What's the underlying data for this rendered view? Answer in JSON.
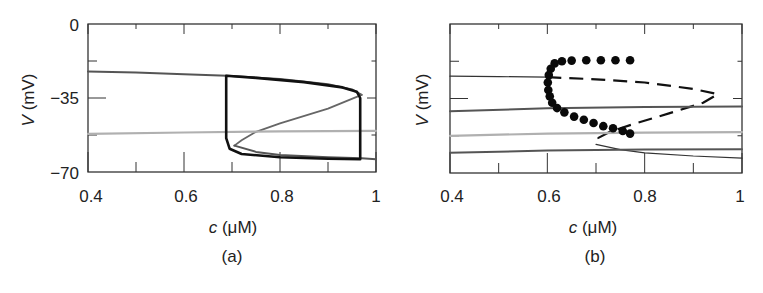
{
  "figure": {
    "panels": [
      {
        "id": "a",
        "caption": "(a)",
        "xlabel_var": "c",
        "xlabel_unit": " (μM)",
        "ylabel_var": "V",
        "ylabel_unit": " (mV)",
        "xticks": [
          "0.4",
          "0.6",
          "0.8",
          "1"
        ],
        "yticks": [
          "0",
          "−35",
          "−70"
        ]
      },
      {
        "id": "b",
        "caption": "(b)",
        "xlabel_var": "c",
        "xlabel_unit": " (μM)",
        "ylabel_var": "V",
        "ylabel_unit": " (mV)",
        "xticks": [
          "0.4",
          "0.6",
          "0.8",
          "1"
        ],
        "yticks": []
      }
    ],
    "colors": {
      "axis": "#333333",
      "stable_branch": "#555555",
      "unstable_branch": "#666666",
      "nullcline": "#b0b0b0",
      "trajectory": "#111111",
      "periodic_orbit_dots": "#0a0a0a"
    }
  },
  "chart_data": [
    {
      "type": "line",
      "title": "(a)",
      "xlabel": "c (μM)",
      "ylabel": "V (mV)",
      "xlim": [
        0.4,
        1.0
      ],
      "ylim": [
        -70,
        0
      ],
      "xticks": [
        0.4,
        0.5,
        0.6,
        0.7,
        0.8,
        0.9,
        1.0
      ],
      "xtick_labels": [
        "0.4",
        "0.6",
        "0.8",
        "1"
      ],
      "yticks": [
        0,
        -17.5,
        -35,
        -52.5,
        -70
      ],
      "ytick_labels": [
        "0",
        "−35",
        "−70"
      ],
      "grid": false,
      "legend": null,
      "series": [
        {
          "name": "upper stable branch (dark gray)",
          "style": "solid",
          "x": [
            0.4,
            0.5,
            0.6,
            0.69,
            0.8,
            0.9,
            0.95,
            0.97
          ],
          "y": [
            -22.5,
            -23,
            -23.8,
            -24.5,
            -26,
            -28.5,
            -31,
            -33.5
          ]
        },
        {
          "name": "middle unstable branch (gray)",
          "style": "solid",
          "x": [
            0.97,
            0.9,
            0.8,
            0.75,
            0.72,
            0.705
          ],
          "y": [
            -33.5,
            -40,
            -47,
            -51,
            -55,
            -57.5
          ]
        },
        {
          "name": "lower stable branch (dark gray)",
          "style": "solid",
          "x": [
            0.705,
            0.75,
            0.8,
            0.9,
            0.97,
            1.0
          ],
          "y": [
            -57.5,
            -60.5,
            -62,
            -63,
            -63.5,
            -64
          ]
        },
        {
          "name": "nullcline (light gray)",
          "style": "solid",
          "x": [
            0.4,
            0.6,
            0.8,
            1.0
          ],
          "y": [
            -52,
            -51.3,
            -50.8,
            -50.5
          ]
        },
        {
          "name": "relaxation oscillation trajectory (black, thick)",
          "style": "solid",
          "x": [
            0.688,
            0.688,
            0.75,
            0.85,
            0.93,
            0.96,
            0.967,
            0.967,
            0.9,
            0.8,
            0.72,
            0.695,
            0.688,
            0.688
          ],
          "y": [
            -24.5,
            -24.5,
            -25.5,
            -27.5,
            -30,
            -32,
            -35,
            -64,
            -63.7,
            -63,
            -61.5,
            -59,
            -54,
            -24.5
          ]
        }
      ]
    },
    {
      "type": "line",
      "title": "(b)",
      "xlabel": "c (μM)",
      "ylabel": "V (mV)",
      "xlim": [
        0.4,
        1.0
      ],
      "ylim": [
        -70,
        0
      ],
      "xticks": [
        0.4,
        0.5,
        0.6,
        0.7,
        0.8,
        0.9,
        1.0
      ],
      "xtick_labels": [
        "0.4",
        "0.6",
        "0.8",
        "1"
      ],
      "grid": false,
      "legend": null,
      "series": [
        {
          "name": "upper stable branch (thin)",
          "style": "solid",
          "x": [
            0.4,
            0.5,
            0.6
          ],
          "y": [
            -24.5,
            -24.7,
            -25
          ]
        },
        {
          "name": "unstable branch (dashed)",
          "style": "dashed",
          "x": [
            0.6,
            0.7,
            0.8,
            0.9,
            0.95,
            0.92,
            0.85,
            0.77,
            0.73,
            0.705,
            0.71
          ],
          "y": [
            -25,
            -26,
            -27.5,
            -30.5,
            -33,
            -37,
            -42,
            -47.5,
            -50.5,
            -53.5,
            -55.5
          ]
        },
        {
          "name": "lower stable branch (thin)",
          "style": "solid",
          "x": [
            0.7,
            0.75,
            0.8,
            0.9,
            1.0
          ],
          "y": [
            -56.5,
            -59,
            -60.5,
            -62,
            -63
          ]
        },
        {
          "name": "V nullcline upper (dark gray)",
          "style": "solid",
          "x": [
            0.4,
            0.6,
            0.8,
            1.0
          ],
          "y": [
            -41,
            -39.6,
            -39,
            -38.8
          ]
        },
        {
          "name": "nullcline middle (light gray)",
          "style": "solid",
          "x": [
            0.4,
            0.6,
            0.8,
            1.0
          ],
          "y": [
            -52.5,
            -51.5,
            -51,
            -50.8
          ]
        },
        {
          "name": "nullcline lower (dark gray)",
          "style": "solid",
          "x": [
            0.4,
            0.6,
            0.8,
            1.0
          ],
          "y": [
            -60.5,
            -59.5,
            -59,
            -58.8
          ]
        },
        {
          "name": "periodic orbit maxima/minima (filled circles)",
          "style": "markers",
          "x": [
            0.77,
            0.74,
            0.71,
            0.68,
            0.65,
            0.63,
            0.615,
            0.607,
            0.603,
            0.601,
            0.602,
            0.605,
            0.61,
            0.62,
            0.635,
            0.655,
            0.675,
            0.695,
            0.715,
            0.735,
            0.755,
            0.77
          ],
          "y": [
            -17,
            -17,
            -17,
            -17,
            -17.2,
            -17.5,
            -18.5,
            -21,
            -24,
            -27.5,
            -31,
            -34,
            -37,
            -39.5,
            -41.5,
            -43.5,
            -45,
            -46.5,
            -48,
            -49,
            -50.3,
            -51.5
          ]
        }
      ]
    }
  ]
}
